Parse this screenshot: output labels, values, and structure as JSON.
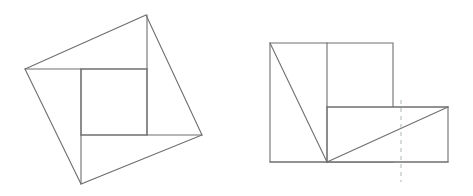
{
  "figure": {
    "canvas": {
      "width": 473,
      "height": 196,
      "background": "#ffffff"
    },
    "style": {
      "stroke_color": "#6f6f6f",
      "stroke_width": 1.1,
      "fill_color": "#ffffff",
      "dashed_color": "#c3cdc3",
      "dashed_width": 1.4,
      "dash_pattern": "4 4"
    },
    "panels": [
      {
        "name": "tilted-square-panel",
        "label": "",
        "description": "Tilted square subdivided by a pinwheel of four segments around a central axis-aligned square",
        "outline": {
          "name": "tilted-square-outline",
          "points": "146,15 202,135 81,184 25,69",
          "closed": true
        },
        "inner_square": {
          "name": "inner-square",
          "x": 81,
          "y": 69,
          "width": 66,
          "height": 66
        },
        "segments": [
          {
            "name": "pinwheel-segment-top-left",
            "x1": 25,
            "y1": 69,
            "x2": 147,
            "y2": 69
          },
          {
            "name": "pinwheel-segment-top-right",
            "x1": 147,
            "y1": 15,
            "x2": 147,
            "y2": 135
          },
          {
            "name": "pinwheel-segment-bottom-right",
            "x1": 202,
            "y1": 135,
            "x2": 81,
            "y2": 135
          },
          {
            "name": "pinwheel-segment-bottom-left",
            "x1": 81,
            "y1": 184,
            "x2": 81,
            "y2": 69
          }
        ]
      },
      {
        "name": "rearranged-rectangles-panel",
        "label": "",
        "description": "Rearranged pieces forming an upper-left rectangle and a lower-right rectangle joined at a common corner, with two diagonals and a dashed vertical reference line",
        "rect_left": {
          "name": "left-rectangle",
          "x": 270,
          "y": 43,
          "width": 123,
          "height": 119
        },
        "rect_right": {
          "name": "right-rectangle",
          "x": 327,
          "y": 107,
          "width": 121,
          "height": 55
        },
        "segments": [
          {
            "name": "vertical-divider",
            "x1": 327,
            "y1": 43,
            "x2": 327,
            "y2": 162
          },
          {
            "name": "ledge-horizontal",
            "x1": 327,
            "y1": 107,
            "x2": 448,
            "y2": 107
          },
          {
            "name": "diagonal-upper-left",
            "x1": 270,
            "y1": 43,
            "x2": 327,
            "y2": 162
          },
          {
            "name": "diagonal-lower-right",
            "x1": 327,
            "y1": 162,
            "x2": 448,
            "y2": 107
          },
          {
            "name": "baseline",
            "x1": 270,
            "y1": 162,
            "x2": 448,
            "y2": 162
          }
        ],
        "dashed_line": {
          "name": "dashed-reference-line",
          "x": 401,
          "y1": 100,
          "y2": 182,
          "color": "#c3cdc3"
        }
      }
    ]
  }
}
